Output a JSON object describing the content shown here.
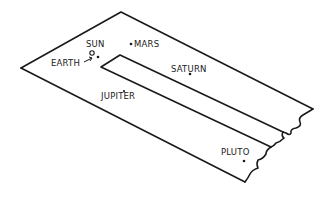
{
  "diagram": {
    "colors": {
      "ink": "#1a1a1a",
      "background": "#ffffff"
    },
    "labels": {
      "sun": "SUN",
      "earth": "EARTH",
      "mars": "MARS",
      "saturn": "SATURN",
      "jupiter": "JUPITER",
      "pluto": "PLUTO"
    },
    "objects": [
      {
        "name": "Sun",
        "label": "SUN",
        "marker": "circle"
      },
      {
        "name": "Earth",
        "label": "EARTH",
        "marker": "arrow-dot"
      },
      {
        "name": "Mars",
        "label": "MARS",
        "marker": "dot"
      },
      {
        "name": "Jupiter",
        "label": "JUPITER",
        "marker": "dot"
      },
      {
        "name": "Saturn",
        "label": "SATURN",
        "marker": "dot"
      },
      {
        "name": "Pluto",
        "label": "PLUTO",
        "marker": "dot"
      }
    ]
  }
}
